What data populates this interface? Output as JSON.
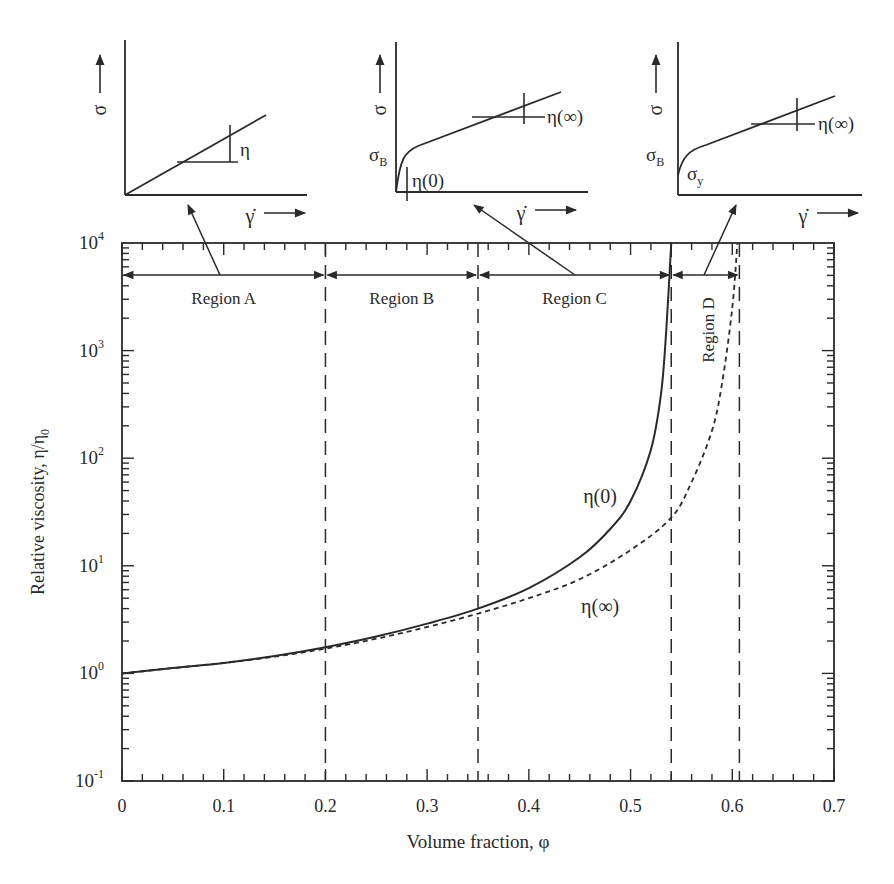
{
  "chart_data": {
    "type": "line",
    "title": "",
    "xlabel": "Volume fraction, φ",
    "ylabel": "Relative viscosity,  η/η",
    "ylabel_sub": "0",
    "xlim": [
      0,
      0.7
    ],
    "ylim": [
      0.1,
      10000
    ],
    "yscale": "log",
    "grid": false,
    "x_ticks": [
      "0",
      "0.1",
      "0.2",
      "0.3",
      "0.4",
      "0.5",
      "0.6",
      "0.7"
    ],
    "y_ticks": [
      {
        "base": "10",
        "exp": "4",
        "value": 10000
      },
      {
        "base": "10",
        "exp": "3",
        "value": 1000
      },
      {
        "base": "10",
        "exp": "2",
        "value": 100
      },
      {
        "base": "10",
        "exp": "1",
        "value": 10
      },
      {
        "base": "10",
        "exp": "0",
        "value": 1
      },
      {
        "base": "10",
        "exp": "-1",
        "value": 0.1
      }
    ],
    "series": [
      {
        "name": "η(0)",
        "style": "solid",
        "x": [
          0,
          0.05,
          0.1,
          0.15,
          0.2,
          0.25,
          0.3,
          0.35,
          0.4,
          0.45,
          0.48,
          0.5,
          0.52,
          0.53,
          0.535,
          0.54
        ],
        "y": [
          1.0,
          1.12,
          1.25,
          1.45,
          1.75,
          2.2,
          2.9,
          4.0,
          6.2,
          12,
          22,
          40,
          120,
          400,
          1500,
          10000
        ]
      },
      {
        "name": "η(∞)",
        "style": "dashed",
        "x": [
          0,
          0.05,
          0.1,
          0.15,
          0.2,
          0.25,
          0.3,
          0.35,
          0.4,
          0.45,
          0.5,
          0.54,
          0.56,
          0.58,
          0.59,
          0.6,
          0.605
        ],
        "y": [
          1.0,
          1.12,
          1.25,
          1.43,
          1.7,
          2.1,
          2.7,
          3.6,
          5.0,
          7.5,
          14,
          28,
          60,
          180,
          500,
          2500,
          10000
        ]
      }
    ],
    "region_boundaries": [
      0.2,
      0.35,
      0.54,
      0.607
    ],
    "regions": [
      {
        "label": "Region A",
        "from": 0,
        "to": 0.2
      },
      {
        "label": "Region B",
        "from": 0.2,
        "to": 0.35
      },
      {
        "label": "Region C",
        "from": 0.35,
        "to": 0.54
      },
      {
        "label": "Region D",
        "from": 0.54,
        "to": 0.607
      }
    ],
    "annotations": [
      {
        "text": "η(0)",
        "x": 0.47,
        "y": 45
      },
      {
        "text": "η(∞)",
        "x": 0.47,
        "y": 4.2
      }
    ],
    "insets": [
      {
        "id": "inset-newtonian",
        "points_to": "Region A",
        "y_label": "σ",
        "x_label": "γ̇",
        "slope_label": "η"
      },
      {
        "id": "inset-bingham-shear-thinning",
        "points_to": "Region C",
        "y_label": "σ",
        "x_label": "γ̇",
        "intercept_label": "σ",
        "intercept_sub": "B",
        "low_rate_label": "η(0)",
        "high_rate_label": "η(∞)"
      },
      {
        "id": "inset-yield-stress",
        "points_to": "Region D",
        "y_label": "σ",
        "x_label": "γ̇",
        "intercept_label": "σ",
        "intercept_sub": "B",
        "yield_label": "σ",
        "yield_sub": "y",
        "high_rate_label": "η(∞)"
      }
    ]
  }
}
